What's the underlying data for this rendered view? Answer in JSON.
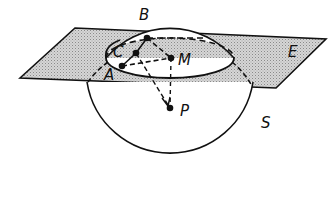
{
  "diagram": {
    "type": "geometry",
    "colors": {
      "stroke": "#111111",
      "plane_fill": "#c8c8c8",
      "background": "#ffffff"
    },
    "plane": {
      "label": "E",
      "points": [
        [
          20,
          78
        ],
        [
          75,
          28
        ],
        [
          326,
          39
        ],
        [
          276,
          88
        ]
      ]
    },
    "sphere": {
      "label": "S",
      "cx": 170,
      "cy": 112,
      "r": 84
    },
    "intersection_circle": {
      "cx": 170,
      "cy": 58,
      "rx": 64,
      "ry": 20
    },
    "points": [
      {
        "id": "A",
        "label": "A",
        "x": 122,
        "y": 66,
        "label_x": 104,
        "label_y": 80
      },
      {
        "id": "B",
        "label": "B",
        "x": 147,
        "y": 38,
        "label_x": 139,
        "label_y": 20
      },
      {
        "id": "C",
        "label": "C",
        "x": 136,
        "y": 53,
        "label_x": 113,
        "label_y": 57
      },
      {
        "id": "M",
        "label": "M",
        "x": 171,
        "y": 58,
        "label_x": 178,
        "label_y": 65
      },
      {
        "id": "P",
        "label": "P",
        "x": 170,
        "y": 108,
        "label_x": 180,
        "label_y": 116
      }
    ],
    "labels": {
      "A": "A",
      "B": "B",
      "C": "C",
      "M": "M",
      "P": "P",
      "E": "E",
      "S": "S"
    },
    "segments": [
      {
        "from": "C",
        "to": "B",
        "style": "solid",
        "arrow": true
      },
      {
        "from": "A",
        "to": "C",
        "style": "solid"
      },
      {
        "from": "A",
        "to": "M",
        "style": "dashed"
      },
      {
        "from": "B",
        "to": "M",
        "style": "dashed"
      },
      {
        "from": "M",
        "to": "P",
        "style": "dashed"
      },
      {
        "from": "C",
        "to": "P",
        "style": "dashed",
        "arrow": true
      }
    ]
  }
}
